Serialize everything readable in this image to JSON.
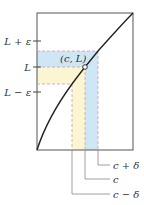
{
  "diagram": {
    "type": "epsilon-delta limit illustration",
    "point_label": "(c, L)",
    "y_labels": {
      "upper": "L + ε",
      "middle": "L",
      "lower": "L − ε"
    },
    "x_labels": {
      "right": "c + δ",
      "middle": "c",
      "left": "c − δ"
    },
    "colors": {
      "frame": "#555555",
      "curve": "#222222",
      "blue_band": "#cfe6f5",
      "yellow_band": "#fbf5d2",
      "dashed_pink": "#c9a0b0",
      "dashed_gray": "#999999",
      "callout": "#888888"
    }
  }
}
